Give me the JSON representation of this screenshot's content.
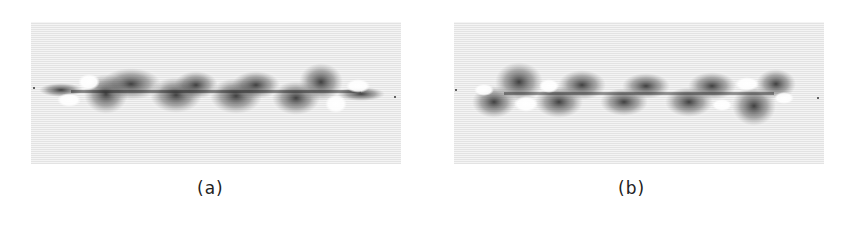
{
  "figure": {
    "panels": [
      {
        "id": "a",
        "caption": "(a)"
      },
      {
        "id": "b",
        "caption": "(b)"
      }
    ],
    "colors": {
      "background": "#f4f4f4",
      "feature": "#1a1a1a",
      "void": "#ffffff"
    }
  }
}
